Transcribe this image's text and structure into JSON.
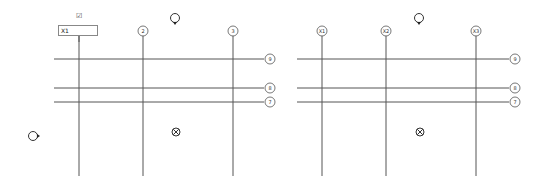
{
  "views": [
    {
      "name": "left-plan",
      "vertical_grids": [
        "1",
        "2",
        "3"
      ],
      "horizontal_grids": [
        "9",
        "8",
        "7"
      ],
      "editing": {
        "value": "X1",
        "confirm_icon": "check-icon"
      }
    },
    {
      "name": "right-plan",
      "vertical_grids": [
        "X1",
        "X2",
        "X3"
      ],
      "horizontal_grids": [
        "9",
        "8",
        "7"
      ]
    }
  ],
  "icons": {
    "elevation_marker": "elevation-marker-icon",
    "section_marker": "section-marker-icon",
    "center_marker": "center-target-icon"
  }
}
